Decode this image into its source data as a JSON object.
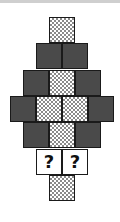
{
  "puzzle": {
    "type": "block-pattern",
    "colors": {
      "dark": "#4a4a4a",
      "checker": "#8a8a8a",
      "unknown": "#ffffff",
      "border": "#1a1a1a"
    },
    "rows": [
      {
        "cells": [
          "checker"
        ]
      },
      {
        "cells": [
          "dark",
          "dark"
        ]
      },
      {
        "cells": [
          "dark",
          "checker",
          "dark"
        ]
      },
      {
        "cells": [
          "dark",
          "checker",
          "checker",
          "dark"
        ]
      },
      {
        "cells": [
          "dark",
          "checker",
          "dark"
        ]
      },
      {
        "cells": [
          "unknown",
          "unknown"
        ]
      },
      {
        "cells": [
          "checker"
        ]
      }
    ],
    "unknown_label": "?"
  }
}
